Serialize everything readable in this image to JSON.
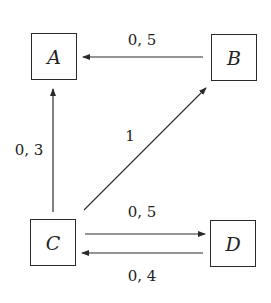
{
  "diagram": {
    "type": "directed-graph",
    "nodes": [
      {
        "id": "A",
        "label": "A"
      },
      {
        "id": "B",
        "label": "B"
      },
      {
        "id": "C",
        "label": "C"
      },
      {
        "id": "D",
        "label": "D"
      }
    ],
    "edges": [
      {
        "from": "B",
        "to": "A",
        "label": "0, 5"
      },
      {
        "from": "C",
        "to": "A",
        "label": "0, 3"
      },
      {
        "from": "C",
        "to": "B",
        "label": "1"
      },
      {
        "from": "C",
        "to": "D",
        "label": "0, 5"
      },
      {
        "from": "D",
        "to": "C",
        "label": "0, 4"
      }
    ],
    "colors": {
      "stroke": "#2a2a2a",
      "background": "#ffffff"
    }
  }
}
